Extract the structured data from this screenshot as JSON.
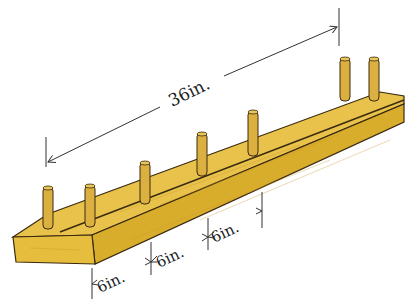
{
  "diagram": {
    "total_length_label": "36in.",
    "spacing_labels": [
      "6in.",
      "6in.",
      "6in."
    ],
    "peg_count": 7,
    "colors": {
      "wood_top": "#e8c24a",
      "wood_side": "#d9ad2c",
      "wood_end": "#e6bd3c",
      "outline": "#3a2a10",
      "dimension_line": "#333333"
    }
  }
}
